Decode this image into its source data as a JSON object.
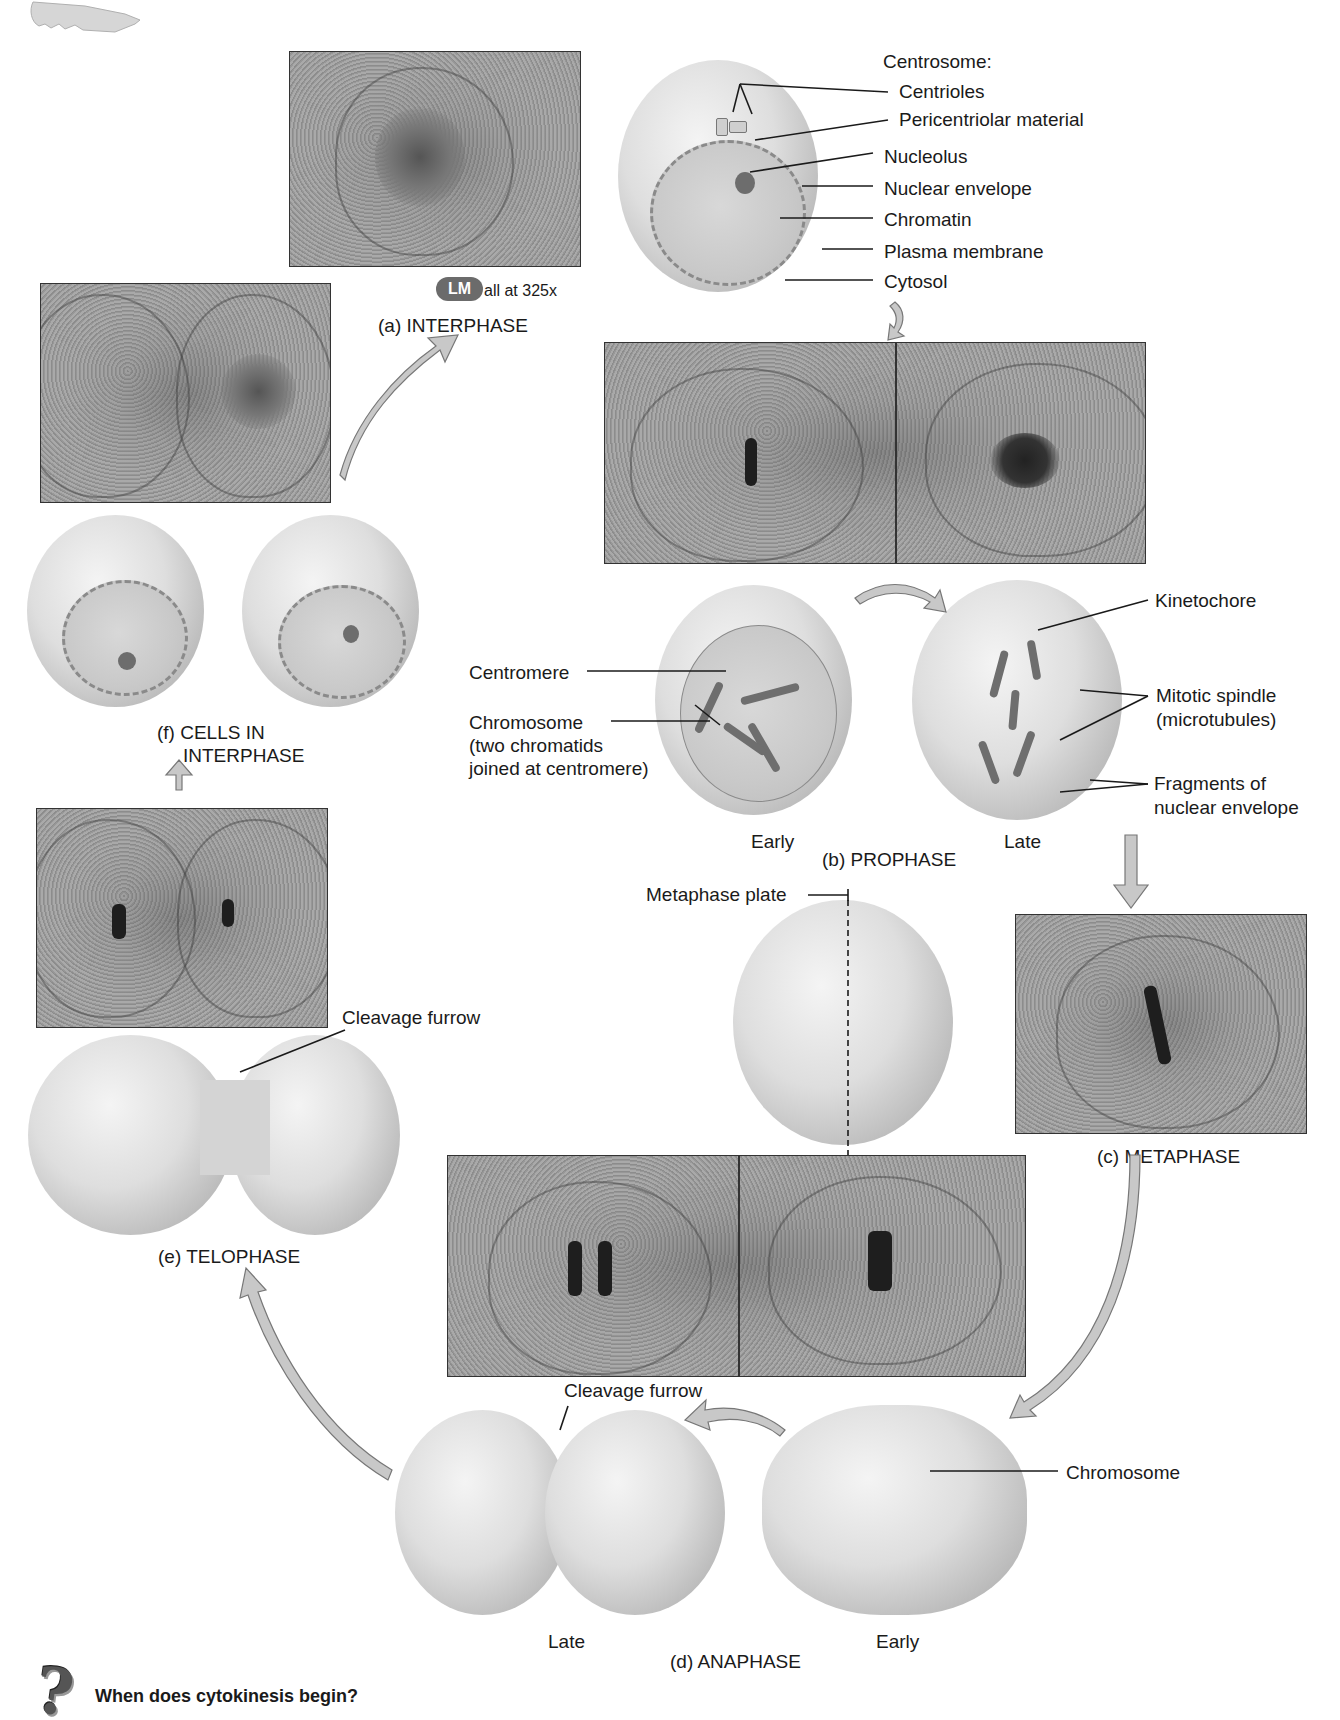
{
  "figure": {
    "decorations": {
      "corner_icon": "key-icon"
    },
    "interphase": {
      "phase_label": "(a) INTERPHASE",
      "magnification_badge": "LM",
      "magnification_text": "all at 325x",
      "centrosome_heading": "Centrosome:",
      "labels": [
        "Centrioles",
        "Pericentriolar material",
        "Nucleolus",
        "Nuclear envelope",
        "Chromatin",
        "Plasma membrane",
        "Cytosol"
      ]
    },
    "prophase": {
      "phase_label": "(b) PROPHASE",
      "early_label": "Early",
      "late_label": "Late",
      "labels": {
        "centromere": "Centromere",
        "chromosome_line1": "Chromosome",
        "chromosome_line2": "(two chromatids",
        "chromosome_line3": "joined at centromere)",
        "kinetochore": "Kinetochore",
        "spindle_line1": "Mitotic spindle",
        "spindle_line2": "(microtubules)",
        "fragments_line1": "Fragments of",
        "fragments_line2": "nuclear envelope"
      }
    },
    "metaphase": {
      "phase_label": "(c) METAPHASE",
      "plate_label": "Metaphase plate"
    },
    "anaphase": {
      "phase_label": "(d) ANAPHASE",
      "late_label": "Late",
      "early_label": "Early",
      "cleavage_label": "Cleavage furrow",
      "chromosome_label": "Chromosome"
    },
    "telophase": {
      "phase_label": "(e) TELOPHASE",
      "cleavage_label": "Cleavage furrow"
    },
    "cells_in_interphase": {
      "phase_label_line1": "(f) CELLS IN",
      "phase_label_line2": "INTERPHASE"
    },
    "question": {
      "icon": "question-mark-icon",
      "text": "When does cytokinesis begin?"
    }
  }
}
